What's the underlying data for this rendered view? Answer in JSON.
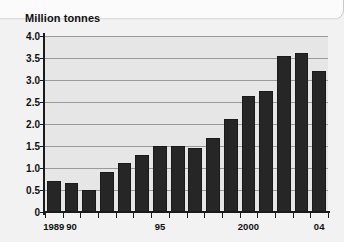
{
  "chart_data": {
    "type": "bar",
    "title": "Million tonnes",
    "xlabel": "",
    "ylabel": "Million tonnes",
    "ylim": [
      0,
      4.0
    ],
    "ytick_labels": [
      "4.0",
      "3.5",
      "3.0",
      "2.5",
      "2.0",
      "1.5",
      "1.0",
      "0.5",
      "0"
    ],
    "ytick_values": [
      4.0,
      3.5,
      3.0,
      2.5,
      2.0,
      1.5,
      1.0,
      0.5,
      0
    ],
    "grid": true,
    "legend": "none",
    "categories": [
      "1989",
      "1990",
      "1991",
      "1992",
      "1993",
      "1994",
      "1995",
      "1996",
      "1997",
      "1998",
      "1999",
      "2000",
      "2001",
      "2002",
      "2003",
      "2004"
    ],
    "xtick_labels": [
      {
        "category": "1989",
        "label": "1989"
      },
      {
        "category": "1990",
        "label": "90"
      },
      {
        "category": "1995",
        "label": "95"
      },
      {
        "category": "2000",
        "label": "2000"
      },
      {
        "category": "2004",
        "label": "04"
      }
    ],
    "values": [
      0.7,
      0.67,
      0.5,
      0.9,
      1.12,
      1.3,
      1.51,
      1.51,
      1.46,
      1.68,
      2.12,
      2.63,
      2.76,
      3.55,
      3.62,
      3.21
    ],
    "colors": {
      "bar": "#262626",
      "plot_background": "#e6e6e6",
      "page_background": "#f2f2f2",
      "gridline": "#9a9a9a",
      "axis": "#1a1a1a",
      "text": "#111111"
    }
  }
}
